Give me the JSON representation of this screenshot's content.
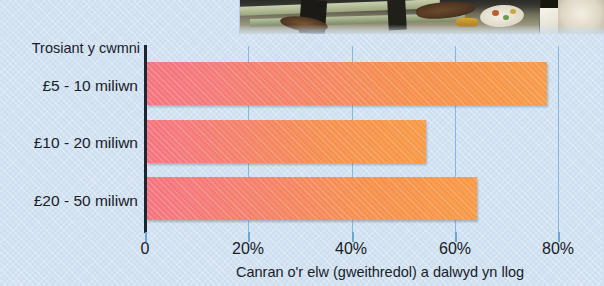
{
  "chart_data": {
    "type": "bar",
    "orientation": "horizontal",
    "title": "",
    "categories": [
      "£5 - 10 miliwn",
      "£10 - 20 miliwn",
      "£20 - 50 miliwn"
    ],
    "values": [
      77.5,
      54,
      64
    ],
    "ylabel": "Trosiant y cwmni",
    "xlabel": "Canran o'r elw (gweithredol) a dalwyd yn llog",
    "xlim": [
      0,
      86
    ],
    "xticks": [
      0,
      20,
      40,
      60,
      80
    ],
    "xtick_labels": [
      "0",
      "20%",
      "40%",
      "60%",
      "80%"
    ],
    "grid": true,
    "gridlines_at": [
      20,
      40,
      60,
      80
    ],
    "legend": null,
    "bar_color_start": "#f4757f",
    "bar_color_end": "#f79b4a",
    "background_color": "#cddff0",
    "gridline_color": "#87b6de",
    "axis_color": "#1c2630"
  },
  "axis": {
    "y_title": "Trosiant y cwmni",
    "x_title": "Canran o'r elw (gweithredol) a dalwyd yn llog"
  },
  "categories": [
    {
      "label": "£5 - 10 miliwn"
    },
    {
      "label": "£10 - 20 miliwn"
    },
    {
      "label": "£20 - 50 miliwn"
    }
  ],
  "ticks": [
    {
      "label": "0"
    },
    {
      "label": "20%"
    },
    {
      "label": "40%"
    },
    {
      "label": "60%"
    },
    {
      "label": "80%"
    }
  ],
  "photo": {
    "alt_name": "workbench-photo-fragment"
  }
}
